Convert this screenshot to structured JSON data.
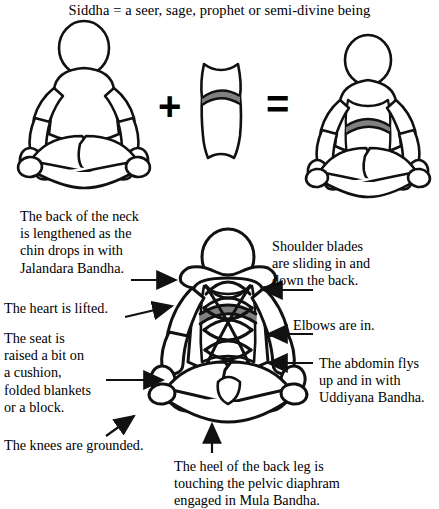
{
  "title": "Siddha = a seer, sage, prophet or semi-divine being",
  "equation": {
    "plus_symbol": "+",
    "equals_symbol": "=",
    "left_figure_name": "seated-figure-plain",
    "middle_figure_name": "torso-diaphragm-shape",
    "right_figure_name": "seated-figure-with-diaphragm"
  },
  "annotations": [
    {
      "id": "neck",
      "text": "The back of the neck is lengthened as the chin drops in with Jalandara Bandha.",
      "lines": [
        "The back of the neck",
        "is lengthened as the",
        "chin drops in with",
        "Jalandara Bandha."
      ],
      "arrow": "arrow-right"
    },
    {
      "id": "heart",
      "text": "The heart is lifted.",
      "lines": [
        "The heart is lifted."
      ],
      "arrow": "arrow-right"
    },
    {
      "id": "seat",
      "text": "The seat is raised a bit on a cushion, folded blankets or a block.",
      "lines": [
        "The seat is",
        "raised a bit on",
        "a cushion,",
        "folded blankets",
        "or a block."
      ],
      "arrow": "arrow-right"
    },
    {
      "id": "knees",
      "text": "The knees are grounded.",
      "lines": [
        "The knees are grounded."
      ],
      "arrow": "arrow-up-right"
    },
    {
      "id": "shoulder-blades",
      "text": "Shoulder blades are sliding in and down the back.",
      "lines": [
        "Shoulder blades",
        "are sliding in and",
        "down the back."
      ],
      "arrow": "arrow-left"
    },
    {
      "id": "elbows",
      "text": "Elbows are in.",
      "lines": [
        "Elbows are in."
      ],
      "arrow": "arrow-left"
    },
    {
      "id": "abdomen",
      "text": "The abdomin flys up and in with Uddiyana Bandha.",
      "lines": [
        "The abdomin flys",
        "up and in with",
        "Uddiyana Bandha."
      ],
      "arrow": "arrow-left"
    },
    {
      "id": "heel",
      "text": "The heel of the back leg is touching the pelvic diaphram engaged in Mula Bandha.",
      "lines": [
        "The heel of the back leg is",
        "touching the pelvic diaphram",
        "engaged in Mula Bandha."
      ],
      "arrow": "arrow-up"
    }
  ],
  "colors": {
    "ink": "#000000",
    "diaphragm_gray": "#808080",
    "background": "#ffffff"
  }
}
